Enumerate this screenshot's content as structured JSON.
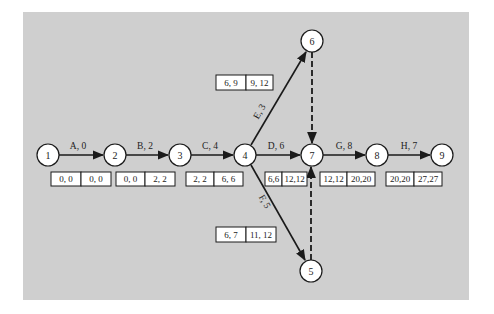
{
  "diagram": {
    "title": "",
    "background": "#cfcfcf",
    "nodes": [
      {
        "id": "1",
        "label": "1",
        "x": 48,
        "y": 155
      },
      {
        "id": "2",
        "label": "2",
        "x": 115,
        "y": 155
      },
      {
        "id": "3",
        "label": "3",
        "x": 180,
        "y": 155
      },
      {
        "id": "4",
        "label": "4",
        "x": 245,
        "y": 155
      },
      {
        "id": "5",
        "label": "5",
        "x": 311,
        "y": 271
      },
      {
        "id": "6",
        "label": "6",
        "x": 312,
        "y": 41
      },
      {
        "id": "7",
        "label": "7",
        "x": 312,
        "y": 155
      },
      {
        "id": "8",
        "label": "8",
        "x": 377,
        "y": 155
      },
      {
        "id": "9",
        "label": "9",
        "x": 442,
        "y": 155
      }
    ],
    "activities": [
      {
        "id": "A",
        "label": "A, 0",
        "from": "1",
        "to": "2",
        "es_ef": "0, 0",
        "ls_lf": "0, 0"
      },
      {
        "id": "B",
        "label": "B, 2",
        "from": "2",
        "to": "3",
        "es_ef": "0, 0",
        "ls_lf": "2, 2"
      },
      {
        "id": "C",
        "label": "C, 4",
        "from": "3",
        "to": "4",
        "es_ef": "2, 2",
        "ls_lf": "6, 6"
      },
      {
        "id": "D",
        "label": "D, 6",
        "from": "4",
        "to": "7",
        "es_ef": "6,6",
        "ls_lf": "12,12"
      },
      {
        "id": "E",
        "label": "E, 3",
        "from": "4",
        "to": "6",
        "es_ef": "6, 9",
        "ls_lf": "9, 12"
      },
      {
        "id": "F",
        "label": "F, 5",
        "from": "4",
        "to": "5",
        "es_ef": "6, 7",
        "ls_lf": "11, 12"
      },
      {
        "id": "G",
        "label": "G, 8",
        "from": "7",
        "to": "8",
        "es_ef": "12,12",
        "ls_lf": "20,20"
      },
      {
        "id": "H",
        "label": "H, 7",
        "from": "8",
        "to": "9",
        "es_ef": "20,20",
        "ls_lf": "27,27"
      }
    ],
    "dummy_activities": [
      {
        "from": "6",
        "to": "7",
        "style": "dashed"
      },
      {
        "from": "5",
        "to": "7",
        "style": "dashed"
      }
    ]
  }
}
